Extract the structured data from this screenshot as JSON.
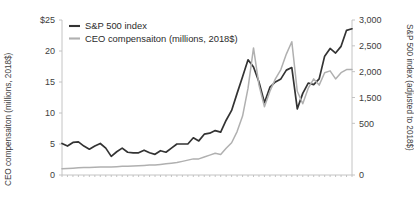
{
  "chart_data": {
    "type": "line",
    "title": "",
    "subtitle": "",
    "xlabel": "",
    "ylabel": "CEO compensaiton (millions, 2018$)",
    "y2label": "S&P 500 index (adjusted to 2018$)",
    "grid": false,
    "legend_position": "top-left",
    "ylim": [
      0,
      25
    ],
    "y2lim": [
      0,
      3000
    ],
    "xlim": [
      1965,
      2018
    ],
    "y_ticks": [
      "$25",
      "20",
      "15",
      "10",
      "5",
      "0"
    ],
    "y_tick_values": [
      25,
      20,
      15,
      10,
      5,
      0
    ],
    "y2_ticks": [
      "3,000",
      "2,500",
      "2,000",
      "1,500",
      "500",
      "0"
    ],
    "y2_tick_values": [
      3000,
      2500,
      2000,
      1500,
      1000,
      0
    ],
    "x_ticks": [],
    "colors": {
      "sp500": "#333333",
      "ceo": "#b0b0b0",
      "axis": "#bdbdbd",
      "text": "#3d3d3d"
    },
    "x": [
      1965,
      1966,
      1967,
      1968,
      1969,
      1970,
      1971,
      1972,
      1973,
      1974,
      1975,
      1976,
      1977,
      1978,
      1979,
      1980,
      1981,
      1982,
      1983,
      1984,
      1985,
      1986,
      1987,
      1988,
      1989,
      1990,
      1991,
      1992,
      1993,
      1994,
      1995,
      1996,
      1997,
      1998,
      1999,
      2000,
      2001,
      2002,
      2003,
      2004,
      2005,
      2006,
      2007,
      2008,
      2009,
      2010,
      2011,
      2012,
      2013,
      2014,
      2015,
      2016,
      2017,
      2018
    ],
    "series": [
      {
        "name": "S&P 500 index",
        "axis": "right",
        "color": "#333333",
        "unit": "index (adjusted to 2018$)",
        "values": [
          610,
          560,
          630,
          640,
          560,
          500,
          560,
          610,
          520,
          360,
          450,
          520,
          440,
          430,
          430,
          480,
          430,
          400,
          470,
          440,
          520,
          600,
          600,
          600,
          720,
          660,
          790,
          810,
          860,
          830,
          1060,
          1250,
          1580,
          1900,
          2230,
          2090,
          1800,
          1400,
          1700,
          1800,
          1860,
          2030,
          2080,
          1280,
          1580,
          1780,
          1750,
          1860,
          2300,
          2450,
          2360,
          2490,
          2800,
          2830
        ]
      },
      {
        "name": "CEO compensaiton (millions, 2018$)",
        "axis": "left",
        "color": "#b0b0b0",
        "unit": "millions, 2018$",
        "values": [
          1.0,
          1.05,
          1.1,
          1.15,
          1.2,
          1.2,
          1.25,
          1.3,
          1.3,
          1.3,
          1.35,
          1.4,
          1.4,
          1.45,
          1.5,
          1.55,
          1.6,
          1.6,
          1.7,
          1.8,
          1.9,
          2.0,
          2.2,
          2.4,
          2.6,
          2.6,
          2.9,
          3.2,
          3.5,
          3.3,
          4.3,
          5.2,
          7.0,
          9.5,
          14.0,
          20.5,
          14.5,
          11.0,
          13.5,
          15.5,
          17.0,
          19.5,
          21.5,
          13.5,
          11.5,
          14.0,
          15.5,
          14.5,
          16.5,
          16.8,
          15.5,
          16.5,
          17.0,
          17.0
        ]
      }
    ],
    "annotations": []
  },
  "legend": {
    "items": [
      {
        "label": "S&P 500 index",
        "color": "#333333"
      },
      {
        "label": "CEO compensaiton (millions, 2018$)",
        "color": "#b0b0b0"
      }
    ]
  }
}
